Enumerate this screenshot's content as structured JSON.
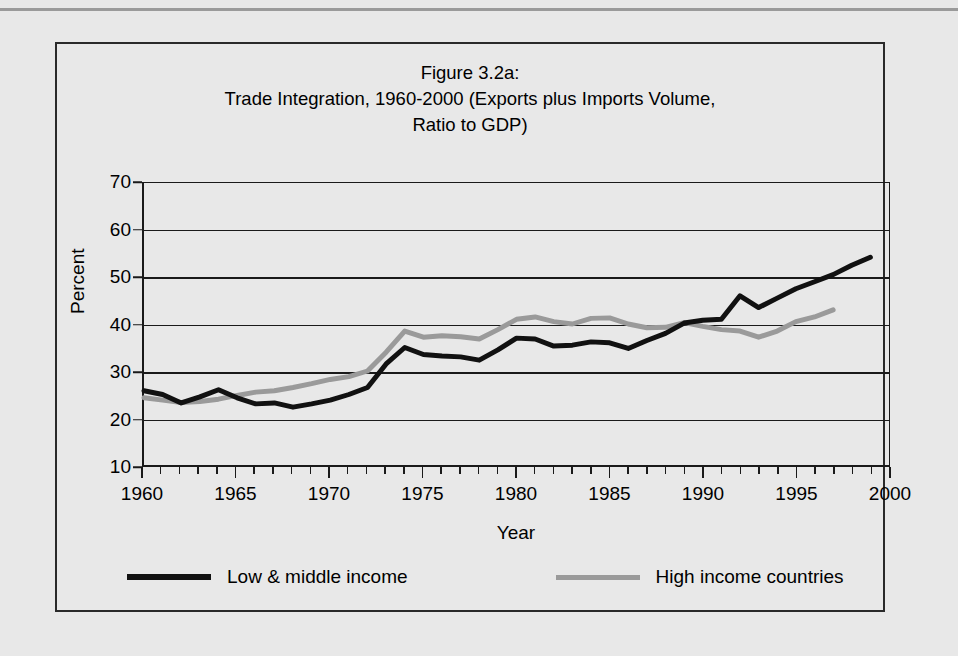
{
  "figure": {
    "title_lines": [
      "Figure 3.2a:",
      "Trade Integration, 1960-2000 (Exports plus Imports Volume,",
      "Ratio to GDP)"
    ],
    "title_line_1": "Figure 3.2a:",
    "title_line_2": "Trade Integration, 1960-2000 (Exports plus Imports Volume,",
    "title_line_3": "Ratio to GDP)"
  },
  "axes": {
    "ylabel": "Percent",
    "xlabel": "Year",
    "y_ticks": [
      "10",
      "20",
      "30",
      "40",
      "50",
      "60",
      "70"
    ],
    "x_ticks": [
      "1960",
      "1965",
      "1970",
      "1975",
      "1980",
      "1985",
      "1990",
      "1995",
      "2000"
    ]
  },
  "legend": {
    "items": [
      {
        "label": "Low & middle income",
        "color": "#111111"
      },
      {
        "label": "High income countries",
        "color": "#9a9a9a"
      }
    ]
  },
  "colors": {
    "low_middle": "#111111",
    "high_income": "#9a9a9a",
    "axis": "#1a1a1a",
    "background": "#e8e8e8",
    "frame": "#2a2a2a"
  },
  "chart_data": {
    "type": "line",
    "title": "Figure 3.2a: Trade Integration, 1960-2000 (Exports plus Imports Volume, Ratio to GDP)",
    "xlabel": "Year",
    "ylabel": "Percent",
    "xlim": [
      1960,
      2000
    ],
    "ylim": [
      10,
      70
    ],
    "y_tick_values": [
      10,
      20,
      30,
      40,
      50,
      60,
      70
    ],
    "x_tick_values": [
      1960,
      1965,
      1970,
      1975,
      1980,
      1985,
      1990,
      1995,
      2000
    ],
    "x_minor_tick_step": 1,
    "grid": "horizontal",
    "legend_position": "bottom",
    "series": [
      {
        "name": "Low & middle income",
        "color": "#111111",
        "x": [
          1960,
          1961,
          1962,
          1963,
          1964,
          1965,
          1966,
          1967,
          1968,
          1969,
          1970,
          1971,
          1972,
          1973,
          1974,
          1975,
          1976,
          1977,
          1978,
          1979,
          1980,
          1981,
          1982,
          1983,
          1984,
          1985,
          1986,
          1987,
          1988,
          1989,
          1990,
          1991,
          1992,
          1993,
          1994,
          1995,
          1996,
          1997,
          1998,
          1999
        ],
        "y": [
          25.8,
          25.0,
          23.2,
          24.5,
          26.0,
          24.3,
          23.0,
          23.2,
          22.3,
          23.0,
          23.8,
          25.0,
          26.5,
          31.5,
          35.0,
          33.5,
          33.2,
          33.0,
          32.3,
          34.5,
          37.0,
          36.8,
          35.3,
          35.5,
          36.2,
          36.0,
          34.8,
          36.5,
          38.0,
          40.2,
          40.8,
          41.0,
          46.0,
          43.5,
          45.5,
          47.5,
          49.0,
          50.5,
          52.5,
          54.2
        ]
      },
      {
        "name": "High income countries",
        "color": "#9a9a9a",
        "x": [
          1960,
          1961,
          1962,
          1963,
          1964,
          1965,
          1966,
          1967,
          1968,
          1969,
          1970,
          1971,
          1972,
          1973,
          1974,
          1975,
          1976,
          1977,
          1978,
          1979,
          1980,
          1981,
          1982,
          1983,
          1984,
          1985,
          1986,
          1987,
          1988,
          1989,
          1990,
          1991,
          1992,
          1993,
          1994,
          1995,
          1996,
          1997
        ],
        "y": [
          24.3,
          23.8,
          23.3,
          23.5,
          24.0,
          24.8,
          25.5,
          25.8,
          26.5,
          27.3,
          28.2,
          28.8,
          30.0,
          34.0,
          38.5,
          37.2,
          37.5,
          37.3,
          36.8,
          38.8,
          41.0,
          41.5,
          40.5,
          40.0,
          41.2,
          41.3,
          40.0,
          39.2,
          39.3,
          40.3,
          39.5,
          38.8,
          38.5,
          37.2,
          38.5,
          40.5,
          41.5,
          43.0
        ]
      }
    ]
  }
}
